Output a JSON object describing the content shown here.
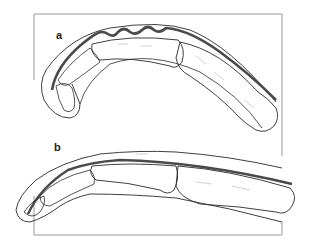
{
  "figure": {
    "panels": [
      {
        "id": "a",
        "label": "a",
        "description": "Bent finger with wavy (lax) extensor tendon, distal joint flexed"
      },
      {
        "id": "b",
        "label": "b",
        "description": "Extended finger with straight extensor tendon along dorsum"
      }
    ],
    "colors": {
      "outline": "#2a2a2a",
      "tendon": "#4a4a4a",
      "frame": "#9a9a9a",
      "background": "#ffffff"
    }
  }
}
